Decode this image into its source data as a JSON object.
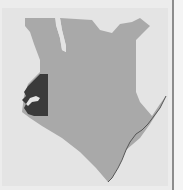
{
  "map": {
    "country": "Kenya",
    "highlighted_region": "Western Kenya",
    "colors": {
      "background": "#e4e4e4",
      "country_fill": "#a9a9a9",
      "highlight_fill": "#3a3a3a",
      "lake_fill": "#e4e4e4",
      "coastline": "#555555",
      "divider": "#8c8c8c"
    }
  }
}
